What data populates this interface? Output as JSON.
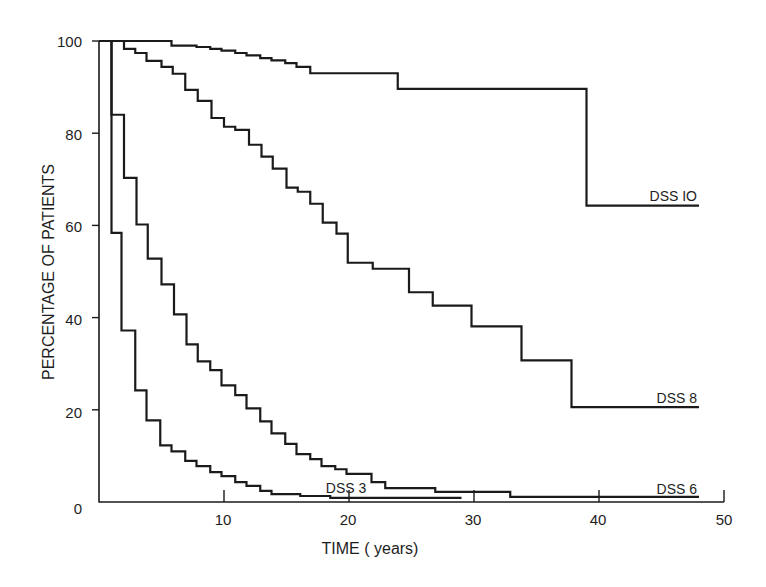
{
  "chart_data": {
    "type": "line",
    "subtype": "step (Kaplan-Meier survival curves)",
    "title": "",
    "xlabel": "TIME ( years)",
    "ylabel": "PERCENTAGE OF PATIENTS",
    "xlim": [
      0,
      50
    ],
    "ylim": [
      0,
      100
    ],
    "x_ticks": [
      0,
      10,
      20,
      30,
      40,
      50
    ],
    "y_ticks": [
      0,
      20,
      40,
      60,
      80,
      100
    ],
    "x_tick_labels": [
      "0",
      "10",
      "20",
      "30",
      "40",
      "50"
    ],
    "y_tick_labels": [
      "0",
      "20",
      "40",
      "60",
      "80",
      "100"
    ],
    "grid": false,
    "legend": "inline labels at right end of each curve",
    "series": [
      {
        "name": "DSS 10",
        "label": "DSS IO",
        "end_year": 48,
        "steps": [
          [
            0,
            100
          ],
          [
            5.8,
            99
          ],
          [
            7.8,
            98.7
          ],
          [
            8.9,
            98.3
          ],
          [
            9.8,
            97.9
          ],
          [
            10.9,
            97.4
          ],
          [
            11.8,
            96.9
          ],
          [
            12.9,
            96.3
          ],
          [
            13.8,
            95.8
          ],
          [
            14.9,
            95.2
          ],
          [
            15.8,
            94.4
          ],
          [
            16.9,
            93
          ],
          [
            23.9,
            89.6
          ],
          [
            39,
            64.3
          ]
        ]
      },
      {
        "name": "DSS 8",
        "label": "DSS 8",
        "end_year": 48,
        "steps": [
          [
            0,
            100
          ],
          [
            2.0,
            98.3
          ],
          [
            2.9,
            97.4
          ],
          [
            3.8,
            95.7
          ],
          [
            5.0,
            94.4
          ],
          [
            5.9,
            92.9
          ],
          [
            6.9,
            89.4
          ],
          [
            7.9,
            87
          ],
          [
            9.0,
            83.3
          ],
          [
            10.0,
            81.4
          ],
          [
            10.9,
            80.7
          ],
          [
            12.0,
            77.5
          ],
          [
            13.0,
            74.9
          ],
          [
            13.9,
            72.3
          ],
          [
            15.0,
            68.2
          ],
          [
            15.9,
            67.3
          ],
          [
            16.9,
            64.7
          ],
          [
            17.9,
            60.6
          ],
          [
            19.0,
            58.2
          ],
          [
            19.9,
            51.9
          ],
          [
            21.9,
            50.6
          ],
          [
            24.8,
            45.5
          ],
          [
            26.7,
            42.6
          ],
          [
            29.8,
            38.1
          ],
          [
            33.8,
            30.7
          ],
          [
            37.8,
            20.6
          ]
        ]
      },
      {
        "name": "DSS 6",
        "label": "DSS 6",
        "end_year": 48,
        "steps": [
          [
            0,
            100
          ],
          [
            1.0,
            84
          ],
          [
            2.0,
            70.3
          ],
          [
            3.0,
            60.2
          ],
          [
            3.9,
            52.8
          ],
          [
            5.0,
            47.2
          ],
          [
            6.0,
            40.7
          ],
          [
            7.0,
            34.2
          ],
          [
            7.9,
            30.5
          ],
          [
            8.9,
            28.6
          ],
          [
            9.8,
            25.3
          ],
          [
            10.9,
            23.2
          ],
          [
            11.8,
            20.3
          ],
          [
            12.9,
            17.5
          ],
          [
            13.8,
            14.9
          ],
          [
            14.9,
            12.6
          ],
          [
            15.8,
            10.4
          ],
          [
            16.9,
            9.3
          ],
          [
            17.8,
            7.8
          ],
          [
            18.9,
            7.1
          ],
          [
            19.8,
            6.1
          ],
          [
            21.8,
            4.3
          ],
          [
            22.9,
            3.0
          ],
          [
            26.9,
            2.2
          ],
          [
            32.9,
            1.1
          ]
        ]
      },
      {
        "name": "DSS 3",
        "label": "DSS 3",
        "end_year": 29,
        "steps": [
          [
            0,
            100
          ],
          [
            1.0,
            58.4
          ],
          [
            1.8,
            37.2
          ],
          [
            2.9,
            24.2
          ],
          [
            3.8,
            17.7
          ],
          [
            4.9,
            12.3
          ],
          [
            5.8,
            11
          ],
          [
            6.9,
            8.9
          ],
          [
            7.8,
            7.8
          ],
          [
            8.9,
            6.5
          ],
          [
            9.8,
            5.6
          ],
          [
            10.9,
            4.3
          ],
          [
            11.8,
            3.5
          ],
          [
            12.9,
            2.4
          ],
          [
            13.8,
            1.7
          ],
          [
            16.1,
            1.3
          ],
          [
            18.5,
            0.9
          ]
        ]
      }
    ],
    "colors": {
      "line": "#1a1a1a",
      "background": "#ffffff"
    }
  },
  "labels": {
    "xlabel": "TIME ( years)",
    "ylabel": "PERCENTAGE OF PATIENTS",
    "series": {
      "dss10": "DSS IO",
      "dss8": "DSS 8",
      "dss6": "DSS 6",
      "dss3": "DSS 3"
    },
    "x_ticks": [
      "0",
      "10",
      "20",
      "30",
      "40",
      "50"
    ],
    "y_ticks": [
      "0",
      "20",
      "40",
      "60",
      "80",
      "100"
    ]
  }
}
